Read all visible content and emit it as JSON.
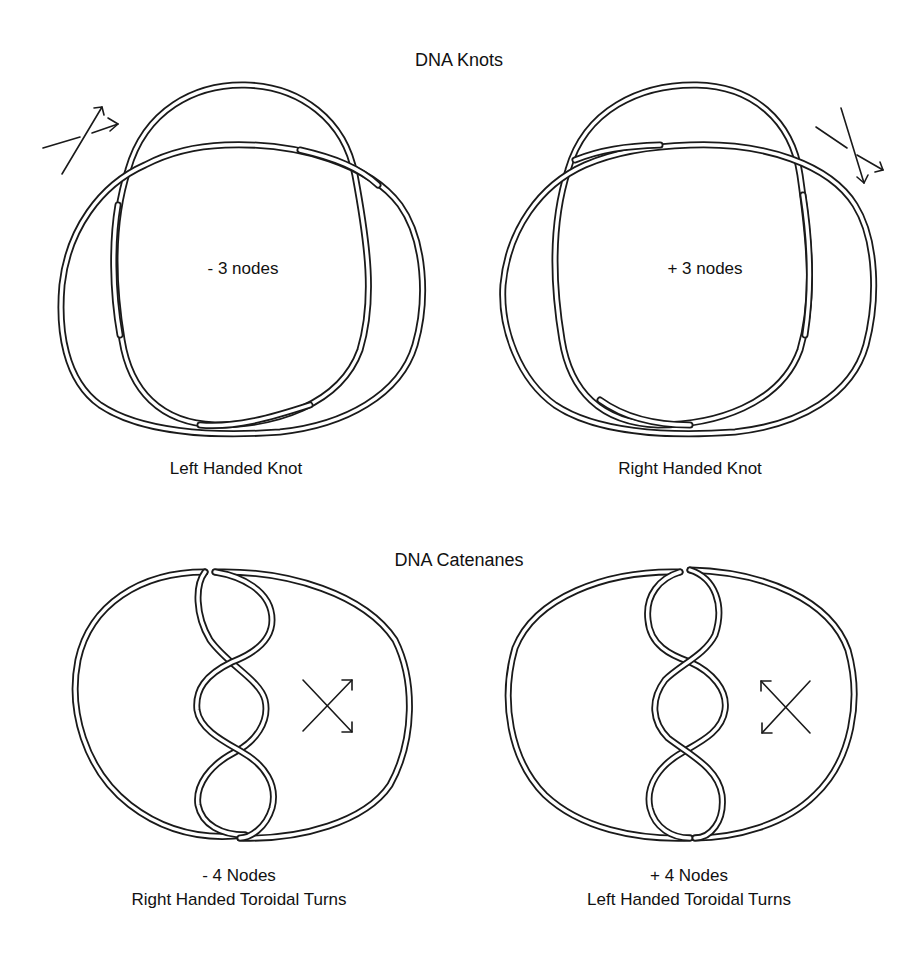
{
  "sections": {
    "knots": {
      "title": "DNA Knots",
      "left": {
        "node_label": "- 3 nodes",
        "caption": "Left Handed Knot"
      },
      "right": {
        "node_label": "+ 3 nodes",
        "caption": "Right Handed Knot"
      }
    },
    "catenanes": {
      "title": "DNA Catenanes",
      "left": {
        "nodes": "- 4 Nodes",
        "caption": "Right Handed Toroidal Turns"
      },
      "right": {
        "nodes": "+ 4 Nodes",
        "caption": "Left Handed Toroidal Turns"
      }
    }
  },
  "icons": {
    "knot_left_crossing": "crossing-arrows-icon",
    "knot_right_crossing": "crossing-arrows-icon",
    "catenane_left_crossing": "crossing-arrows-icon",
    "catenane_right_crossing": "crossing-arrows-icon"
  },
  "colors": {
    "line": "#1a1a1a",
    "background": "#ffffff"
  }
}
